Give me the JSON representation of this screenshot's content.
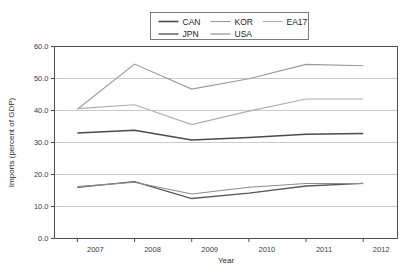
{
  "chart_data": {
    "type": "line",
    "title": "",
    "xlabel": "Year",
    "ylabel": "Imports (percent of GDP)",
    "x": [
      2007,
      2008,
      2009,
      2010,
      2011,
      2012
    ],
    "xtick_labels": [
      "2007",
      "2008",
      "2009",
      "2010",
      "2011",
      "2012"
    ],
    "ytick_labels": [
      "0.0",
      "10.0",
      "20.0",
      "30.0",
      "40.0",
      "50.0",
      "60.0"
    ],
    "ytick_values": [
      0,
      10,
      20,
      30,
      40,
      50,
      60
    ],
    "ylim": [
      0,
      60
    ],
    "xlim": [
      2006.6,
      2012.6
    ],
    "grid": true,
    "legend_position": "top-center",
    "series": [
      {
        "name": "CAN",
        "color": "#4a4a4a",
        "width": 1.5,
        "values": [
          33.0,
          33.8,
          30.8,
          31.6,
          32.6,
          32.8
        ]
      },
      {
        "name": "KOR",
        "color": "#9a9a9a",
        "width": 1.1,
        "values": [
          40.4,
          54.5,
          46.7,
          49.9,
          54.4,
          54.0
        ]
      },
      {
        "name": "EA17",
        "color": "#aeaeae",
        "width": 1.1,
        "values": [
          40.6,
          41.8,
          35.6,
          39.8,
          43.6,
          43.6
        ]
      },
      {
        "name": "JPN",
        "color": "#575757",
        "width": 1.3,
        "values": [
          16.0,
          17.8,
          12.5,
          14.2,
          16.4,
          17.2
        ]
      },
      {
        "name": "USA",
        "color": "#8b8b8b",
        "width": 1.1,
        "values": [
          16.2,
          17.6,
          13.9,
          16.0,
          17.2,
          17.2
        ]
      }
    ],
    "legend_rows": [
      [
        {
          "name": "CAN",
          "color": "#4a4a4a",
          "width": 1.6
        },
        {
          "name": "KOR",
          "color": "#9a9a9a",
          "width": 1.1
        },
        {
          "name": "EA17",
          "color": "#aeaeae",
          "width": 1.1
        }
      ],
      [
        {
          "name": "JPN",
          "color": "#575757",
          "width": 1.4
        },
        {
          "name": "USA",
          "color": "#8b8b8b",
          "width": 1.1
        }
      ]
    ]
  }
}
